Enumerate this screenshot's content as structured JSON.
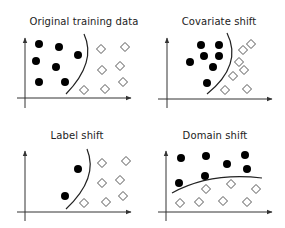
{
  "figure": {
    "width": 285,
    "height": 228,
    "colors": {
      "axis": "#333333",
      "boundary": "#222222",
      "dot_fill": "#000000",
      "diamond_stroke": "#555555",
      "diamond_fill": "#ffffff",
      "title": "#222222"
    },
    "marker_sizes": {
      "dot_radius": 4,
      "diamond_half": 4.5
    }
  },
  "panels": [
    {
      "id": "original",
      "title": "Original training data",
      "title_pos": [
        84,
        16
      ],
      "axes": {
        "origin_x": 25,
        "y_top": 38,
        "y_bottom": 108,
        "x_axis_y": 98,
        "x_left": 17,
        "x_right": 131
      },
      "boundary": "M 84 34 Q 97 62 66 94",
      "class_a_dots": [
        [
          39,
          44
        ],
        [
          59,
          47
        ],
        [
          36,
          61
        ],
        [
          78,
          55
        ],
        [
          56,
          67
        ],
        [
          39,
          82
        ],
        [
          65,
          82
        ]
      ],
      "class_b_diamonds": [
        [
          101,
          49
        ],
        [
          125,
          47
        ],
        [
          102,
          70
        ],
        [
          120,
          66
        ],
        [
          84,
          90
        ],
        [
          105,
          89
        ],
        [
          123,
          82
        ]
      ]
    },
    {
      "id": "covariate",
      "title": "Covariate shift",
      "title_pos": [
        219,
        16
      ],
      "axes": {
        "origin_x": 167,
        "y_top": 38,
        "y_bottom": 108,
        "x_axis_y": 99,
        "x_left": 158,
        "x_right": 272
      },
      "boundary": "M 227 33 Q 243 65 207 94",
      "class_a_dots": [
        [
          201,
          45
        ],
        [
          219,
          45
        ],
        [
          204,
          56
        ],
        [
          219,
          56
        ],
        [
          190,
          62
        ],
        [
          213,
          67
        ],
        [
          207,
          83
        ]
      ],
      "class_b_diamonds": [
        [
          251,
          44
        ],
        [
          243,
          50
        ],
        [
          239,
          62
        ],
        [
          244,
          70
        ],
        [
          233,
          76
        ],
        [
          225,
          90
        ],
        [
          247,
          89
        ]
      ]
    },
    {
      "id": "label",
      "title": "Label shift",
      "title_pos": [
        77,
        130
      ],
      "axes": {
        "origin_x": 25,
        "y_top": 151,
        "y_bottom": 221,
        "x_axis_y": 212,
        "x_left": 17,
        "x_right": 131
      },
      "boundary": "M 87 149 Q 99 178 66 209",
      "class_a_dots": [
        [
          78,
          169
        ],
        [
          65,
          196
        ]
      ],
      "class_b_diamonds": [
        [
          102,
          163
        ],
        [
          126,
          161
        ],
        [
          102,
          183
        ],
        [
          120,
          180
        ],
        [
          84,
          203
        ],
        [
          106,
          202
        ],
        [
          123,
          196
        ]
      ]
    },
    {
      "id": "domain",
      "title": "Domain shift",
      "title_pos": [
        215,
        130
      ],
      "axes": {
        "origin_x": 166,
        "y_top": 151,
        "y_bottom": 221,
        "x_axis_y": 212,
        "x_left": 158,
        "x_right": 272
      },
      "boundary": "M 172 193 Q 210 172 262 178",
      "class_a_dots": [
        [
          181,
          158
        ],
        [
          206,
          156
        ],
        [
          227,
          164
        ],
        [
          245,
          155
        ],
        [
          247,
          169
        ],
        [
          179,
          183
        ],
        [
          205,
          176
        ]
      ],
      "class_b_diamonds": [
        [
          206,
          189
        ],
        [
          231,
          184
        ],
        [
          256,
          189
        ],
        [
          180,
          203
        ],
        [
          199,
          202
        ],
        [
          223,
          201
        ],
        [
          247,
          202
        ]
      ]
    }
  ]
}
